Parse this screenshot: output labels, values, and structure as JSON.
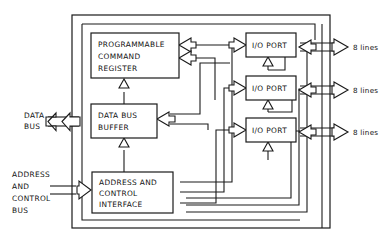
{
  "diagram": {
    "type": "block-diagram",
    "canvas": {
      "width": 392,
      "height": 245
    },
    "colors": {
      "background": "#ffffff",
      "stroke": "#1a1a1a",
      "text": "#111111",
      "block_fill": "#ffffff"
    },
    "chip_boundary": {
      "x": 72,
      "y": 15,
      "width": 258,
      "height": 213
    },
    "blocks": [
      {
        "id": "programmable-command-register",
        "lines": [
          "PROGRAMMABLE",
          "COMMAND",
          "REGISTER"
        ],
        "x": 91,
        "y": 33,
        "width": 88,
        "height": 45
      },
      {
        "id": "data-bus-buffer",
        "lines": [
          "DATA BUS",
          "BUFFER"
        ],
        "x": 91,
        "y": 104,
        "width": 66,
        "height": 34
      },
      {
        "id": "address-and-control-interface",
        "lines": [
          "ADDRESS AND",
          "CONTROL",
          "INTERFACE"
        ],
        "x": 92,
        "y": 172,
        "width": 81,
        "height": 41
      },
      {
        "id": "io-port-1",
        "lines": [
          "I/O PORT"
        ],
        "x": 246,
        "y": 33,
        "width": 50,
        "height": 24
      },
      {
        "id": "io-port-2",
        "lines": [
          "I/O PORT"
        ],
        "x": 246,
        "y": 76,
        "width": 50,
        "height": 24
      },
      {
        "id": "io-port-3",
        "lines": [
          "I/O PORT"
        ],
        "x": 246,
        "y": 118,
        "width": 50,
        "height": 24
      }
    ],
    "external_labels": [
      {
        "id": "data-bus",
        "lines": [
          "DATA",
          "BUS"
        ],
        "x": 24,
        "y": 115
      },
      {
        "id": "address-and-control-bus",
        "lines": [
          "ADDRESS",
          "AND",
          "CONTROL",
          "BUS"
        ],
        "x": 12,
        "y": 172
      }
    ],
    "port_line_labels": [
      {
        "id": "io-port-1-lines",
        "text": "8 lines",
        "x": 351,
        "y": 47
      },
      {
        "id": "io-port-2-lines",
        "text": "8 lines",
        "x": 351,
        "y": 90
      },
      {
        "id": "io-port-3-lines",
        "text": "8 lines",
        "x": 351,
        "y": 132
      }
    ]
  }
}
